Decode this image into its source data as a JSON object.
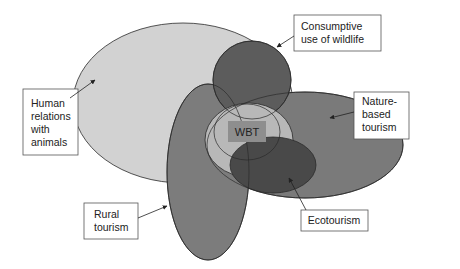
{
  "diagram": {
    "type": "overlapping-ellipse-diagram",
    "center_label": "WBT",
    "labels": {
      "human_relations": [
        "Human",
        "relations",
        "with",
        "animals"
      ],
      "consumptive": [
        "Consumptive",
        "use of wildlife"
      ],
      "nature_based": [
        "Nature-",
        "based",
        "tourism"
      ],
      "rural": [
        "Rural",
        "tourism"
      ],
      "ecotourism": [
        "Ecotourism"
      ]
    },
    "colors": {
      "human_relations_fill": "#d2d2d2",
      "rural_fill": "#7c7c7c",
      "nature_based_fill": "#7a7a7a",
      "consumptive_fill": "#5c5c5c",
      "wbt_region_fill": "#b8b8b8",
      "ecotourism_fill": "#494949",
      "wbt_box_fill": "#8e8e8e",
      "outline": "#2a2a2a"
    }
  }
}
